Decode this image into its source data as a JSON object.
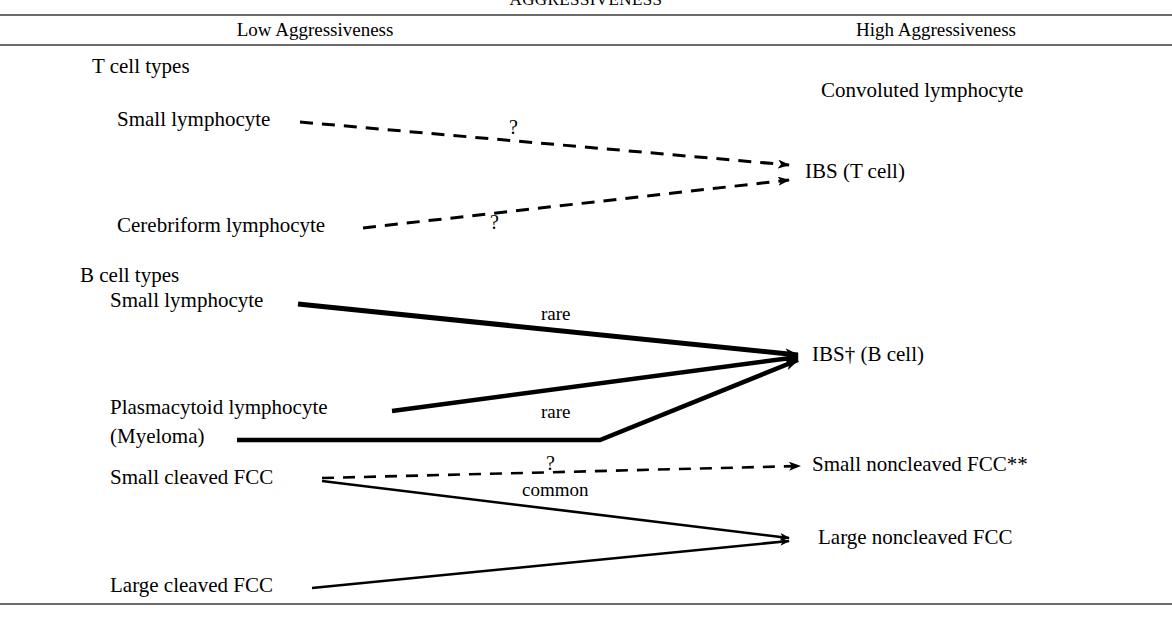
{
  "figure": {
    "title": "AGGRESSIVENESS",
    "columns": {
      "low": "Low Aggressiveness",
      "high": "High Aggressiveness"
    }
  },
  "sections": {
    "t_cell": {
      "heading": "T cell types",
      "low_nodes": [
        "Small lymphocyte",
        "Cerebriform lymphocyte"
      ],
      "high_nodes": [
        "Convoluted lymphocyte",
        "IBS (T cell)"
      ]
    },
    "b_cell": {
      "heading": "B cell types",
      "low_nodes": [
        "Small lymphocyte",
        "Plasmacytoid lymphocyte",
        "(Myeloma)",
        "Small cleaved FCC",
        "Large cleaved FCC"
      ],
      "high_nodes": [
        "IBS† (B cell)",
        "Small noncleaved FCC**",
        "Large noncleaved FCC"
      ]
    }
  },
  "edge_labels": {
    "t_small_lymphocyte": "?",
    "t_cerebriform": "?",
    "b_small_lymphocyte": "rare",
    "b_plasmacytoid": "rare",
    "b_small_cleaved_dashed_q": "?",
    "b_small_cleaved_common": "common"
  },
  "style": {
    "ink": "#000000",
    "rule_color": "#6b6b6b",
    "background": "#ffffff"
  }
}
